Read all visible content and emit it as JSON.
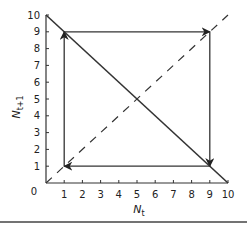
{
  "chart_data": {
    "type": "line",
    "title": "",
    "xlabel": "N_t",
    "ylabel": "N_t+1",
    "xlim": [
      0,
      10
    ],
    "ylim": [
      0,
      10
    ],
    "grid": false,
    "legend": null,
    "x_ticks": [
      "1",
      "2",
      "3",
      "4",
      "5",
      "6",
      "7",
      "8",
      "9",
      "10"
    ],
    "y_ticks": [
      "0",
      "1",
      "2",
      "3",
      "4",
      "5",
      "6",
      "7",
      "8",
      "9",
      "10"
    ],
    "series": [
      {
        "name": "recruitment line",
        "style": "solid",
        "points": [
          [
            0,
            10
          ],
          [
            10,
            0
          ]
        ]
      },
      {
        "name": "replacement line (N_t+1 = N_t)",
        "style": "dashed",
        "points": [
          [
            0,
            0
          ],
          [
            10,
            10
          ]
        ]
      },
      {
        "name": "cobweb cycle",
        "style": "solid-arrows",
        "points": [
          [
            1,
            1
          ],
          [
            1,
            9
          ],
          [
            9,
            9
          ],
          [
            9,
            1
          ],
          [
            1,
            1
          ]
        ]
      }
    ],
    "annotations": [
      "Two-point cycle between N=1 and N=9"
    ]
  },
  "labels": {
    "x_axis_main": "N",
    "x_axis_sub": "t",
    "y_axis_main": "N",
    "y_axis_sub": "t+1",
    "origin": "0"
  }
}
